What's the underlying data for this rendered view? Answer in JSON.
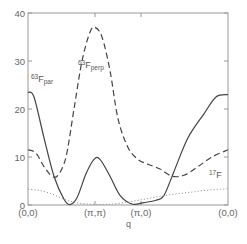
{
  "chart_data": {
    "type": "line",
    "title": "",
    "xlabel": "q",
    "ylabel": "",
    "x_tick_labels": [
      "(0,0)",
      "(π,π)",
      "(π,0)",
      "(0,0)"
    ],
    "y_tick_labels": [
      "0",
      "10",
      "20",
      "30",
      "40"
    ],
    "ylim": [
      0,
      40
    ],
    "grid": false,
    "legend": "inline labels",
    "x": [
      0,
      0.05,
      0.1,
      0.15,
      0.2,
      0.25,
      0.3,
      0.35,
      0.4,
      0.45,
      0.5,
      0.55,
      0.6,
      0.65,
      0.7,
      0.75,
      0.8,
      0.85,
      0.9,
      0.95,
      1.0
    ],
    "series": [
      {
        "name": "63F_par",
        "label_main": "63",
        "label_F": "F",
        "label_sub": "par",
        "style": "solid",
        "points": [
          [
            0,
            23.5
          ],
          [
            0.03,
            22.5
          ],
          [
            0.08,
            14
          ],
          [
            0.13,
            6
          ],
          [
            0.18,
            1.2
          ],
          [
            0.21,
            0.1
          ],
          [
            0.245,
            1.5
          ],
          [
            0.29,
            6.5
          ],
          [
            0.33,
            9.5
          ],
          [
            0.36,
            9.5
          ],
          [
            0.41,
            6
          ],
          [
            0.46,
            2
          ],
          [
            0.52,
            0.2
          ],
          [
            0.58,
            0.5
          ],
          [
            0.64,
            1
          ],
          [
            0.68,
            2
          ],
          [
            0.73,
            7
          ],
          [
            0.8,
            14
          ],
          [
            0.88,
            19
          ],
          [
            0.94,
            22.5
          ],
          [
            1.0,
            23
          ]
        ]
      },
      {
        "name": "63F_perp",
        "label_main": "63",
        "label_F": "F",
        "label_sub": "perp",
        "style": "dashed",
        "points": [
          [
            0,
            11.5
          ],
          [
            0.04,
            10.8
          ],
          [
            0.08,
            8
          ],
          [
            0.12,
            6
          ],
          [
            0.15,
            6.2
          ],
          [
            0.19,
            10
          ],
          [
            0.23,
            20
          ],
          [
            0.27,
            30
          ],
          [
            0.31,
            36
          ],
          [
            0.335,
            37
          ],
          [
            0.37,
            35
          ],
          [
            0.41,
            28
          ],
          [
            0.45,
            18
          ],
          [
            0.5,
            12
          ],
          [
            0.55,
            9.5
          ],
          [
            0.6,
            8.5
          ],
          [
            0.66,
            7.5
          ],
          [
            0.72,
            6
          ],
          [
            0.78,
            6.2
          ],
          [
            0.85,
            8
          ],
          [
            0.92,
            10
          ],
          [
            1.0,
            11.5
          ]
        ]
      },
      {
        "name": "17F",
        "label_main": "17",
        "label_F": "F",
        "label_sub": "",
        "style": "dotted",
        "points": [
          [
            0,
            3.3
          ],
          [
            0.06,
            3
          ],
          [
            0.12,
            2.3
          ],
          [
            0.18,
            1.2
          ],
          [
            0.24,
            0.5
          ],
          [
            0.3,
            0.2
          ],
          [
            0.36,
            0.1
          ],
          [
            0.42,
            0.2
          ],
          [
            0.5,
            0.6
          ],
          [
            0.58,
            1.2
          ],
          [
            0.66,
            1.8
          ],
          [
            0.74,
            2.3
          ],
          [
            0.82,
            2.7
          ],
          [
            0.9,
            3.1
          ],
          [
            1.0,
            3.4
          ]
        ]
      }
    ],
    "x_tick_positions": [
      0,
      0.335,
      0.565,
      1.0
    ]
  },
  "axes": {
    "x_title": "q"
  }
}
